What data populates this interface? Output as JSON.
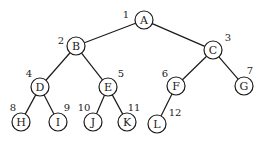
{
  "diagram": {
    "type": "binary-tree",
    "node_radius": 9,
    "nodes": [
      {
        "id": "A",
        "label": "A",
        "order": "1",
        "x": 144,
        "y": 20,
        "ox": 126,
        "oy": 14
      },
      {
        "id": "B",
        "label": "B",
        "order": "2",
        "x": 76,
        "y": 46,
        "ox": 61,
        "oy": 40
      },
      {
        "id": "C",
        "label": "C",
        "order": "3",
        "x": 213,
        "y": 50,
        "ox": 228,
        "oy": 37
      },
      {
        "id": "D",
        "label": "D",
        "order": "4",
        "x": 40,
        "y": 87,
        "ox": 29,
        "oy": 73
      },
      {
        "id": "E",
        "label": "E",
        "order": "5",
        "x": 108,
        "y": 87,
        "ox": 121,
        "oy": 73
      },
      {
        "id": "F",
        "label": "F",
        "order": "6",
        "x": 176,
        "y": 86,
        "ox": 165,
        "oy": 73
      },
      {
        "id": "G",
        "label": "G",
        "order": "7",
        "x": 244,
        "y": 86,
        "ox": 250,
        "oy": 70
      },
      {
        "id": "H",
        "label": "H",
        "order": "8",
        "x": 21,
        "y": 122,
        "ox": 13,
        "oy": 107
      },
      {
        "id": "I",
        "label": "I",
        "order": "9",
        "x": 58,
        "y": 122,
        "ox": 67,
        "oy": 107
      },
      {
        "id": "J",
        "label": "J",
        "order": "10",
        "x": 93,
        "y": 122,
        "ox": 84,
        "oy": 107
      },
      {
        "id": "K",
        "label": "K",
        "order": "11",
        "x": 127,
        "y": 122,
        "ox": 134,
        "oy": 107
      },
      {
        "id": "L",
        "label": "L",
        "order": "12",
        "x": 157,
        "y": 124,
        "ox": 175,
        "oy": 112
      }
    ],
    "edges": [
      {
        "from": "A",
        "to": "B"
      },
      {
        "from": "A",
        "to": "C"
      },
      {
        "from": "B",
        "to": "D"
      },
      {
        "from": "B",
        "to": "E"
      },
      {
        "from": "C",
        "to": "F"
      },
      {
        "from": "C",
        "to": "G"
      },
      {
        "from": "D",
        "to": "H"
      },
      {
        "from": "D",
        "to": "I"
      },
      {
        "from": "E",
        "to": "J"
      },
      {
        "from": "E",
        "to": "K"
      },
      {
        "from": "F",
        "to": "L"
      }
    ]
  }
}
